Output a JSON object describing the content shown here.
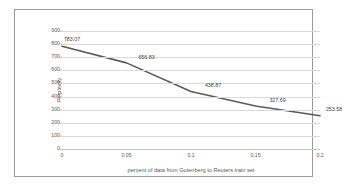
{
  "chart_data": {
    "type": "line",
    "title": "",
    "xlabel": "percent of data from Gutenberg to Reuters train set",
    "ylabel": "Perplexity",
    "x": [
      0,
      0.05,
      0.1,
      0.15,
      0.2
    ],
    "xtick_labels": [
      "0",
      "0.05",
      "0.1",
      "0.15",
      "0.2"
    ],
    "values": [
      783.07,
      656.83,
      438.87,
      327.69,
      253.58
    ],
    "point_labels": [
      "783.07",
      "656.83",
      "438.87",
      "327.69",
      "253.58"
    ],
    "ylim": [
      0,
      900
    ],
    "ytick_labels": [
      "900",
      "800",
      "700",
      "600",
      "500",
      "400",
      "300",
      "200",
      "100",
      "0"
    ],
    "ytick_values": [
      900,
      800,
      700,
      600,
      500,
      400,
      300,
      200,
      100,
      0
    ],
    "xlim": [
      0,
      0.2
    ],
    "grid": "horizontal",
    "legend": "none",
    "series": [
      {
        "name": "Perplexity",
        "values": [
          783.07,
          656.83,
          438.87,
          327.69,
          253.58
        ]
      }
    ],
    "colors": {
      "line": "#5a5a5a",
      "gridline": "#d9d9d9",
      "frame": "#9a9a9a",
      "text": "#5a5a5a",
      "label_text": "#3f3f3f",
      "background": "#ffffff"
    }
  }
}
